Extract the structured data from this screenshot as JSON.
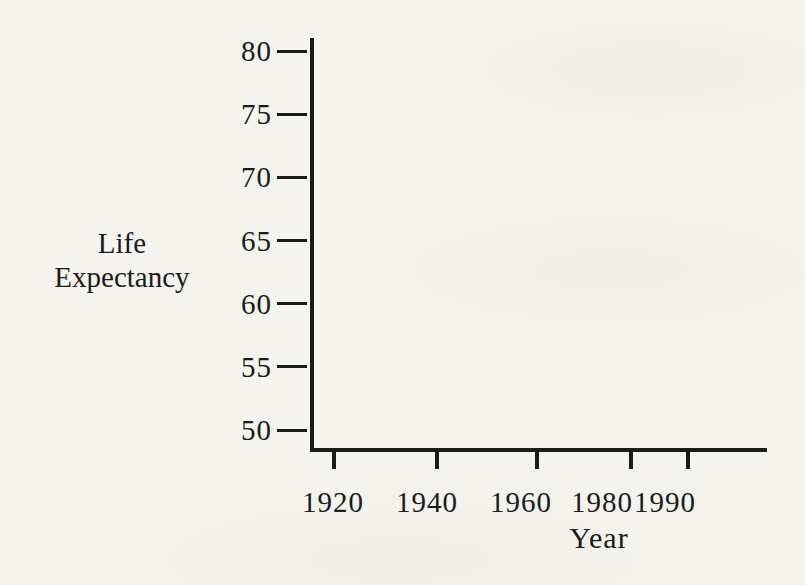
{
  "page": {
    "paper_color": "#f4f3ee",
    "ink_color": "#1b1b1b"
  },
  "labels": {
    "y_axis_line1": "Life",
    "y_axis_line2": "Expectancy",
    "x_axis": "Year"
  },
  "chart_data": {
    "type": "line",
    "title": "",
    "xlabel": "Year",
    "ylabel": "Life Expectancy",
    "x_ticks": [
      "1920",
      "1940",
      "1960",
      "1980",
      "1990"
    ],
    "y_ticks": [
      "80",
      "75",
      "70",
      "65",
      "60",
      "55",
      "50"
    ],
    "xlim": [
      1915,
      1998
    ],
    "ylim": [
      48.5,
      81
    ],
    "grid": false,
    "legend": "none",
    "series": []
  }
}
